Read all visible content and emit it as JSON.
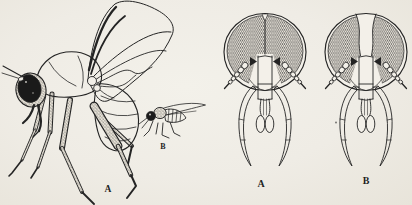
{
  "figure": {
    "kind": "scientific-line-illustration-of-flies",
    "background_color": "#efece5",
    "ink_color": "#242424",
    "panels": {
      "fly_large": {
        "label": "A",
        "semantic": "adult-fly-lateral-view"
      },
      "fly_small": {
        "label": "B",
        "semantic": "small-fly-lateral-view"
      },
      "head_left": {
        "label": "A",
        "semantic": "fly-head-frontal-eyes-meeting"
      },
      "head_right": {
        "label": "B",
        "semantic": "fly-head-frontal-eyes-separated"
      }
    }
  }
}
